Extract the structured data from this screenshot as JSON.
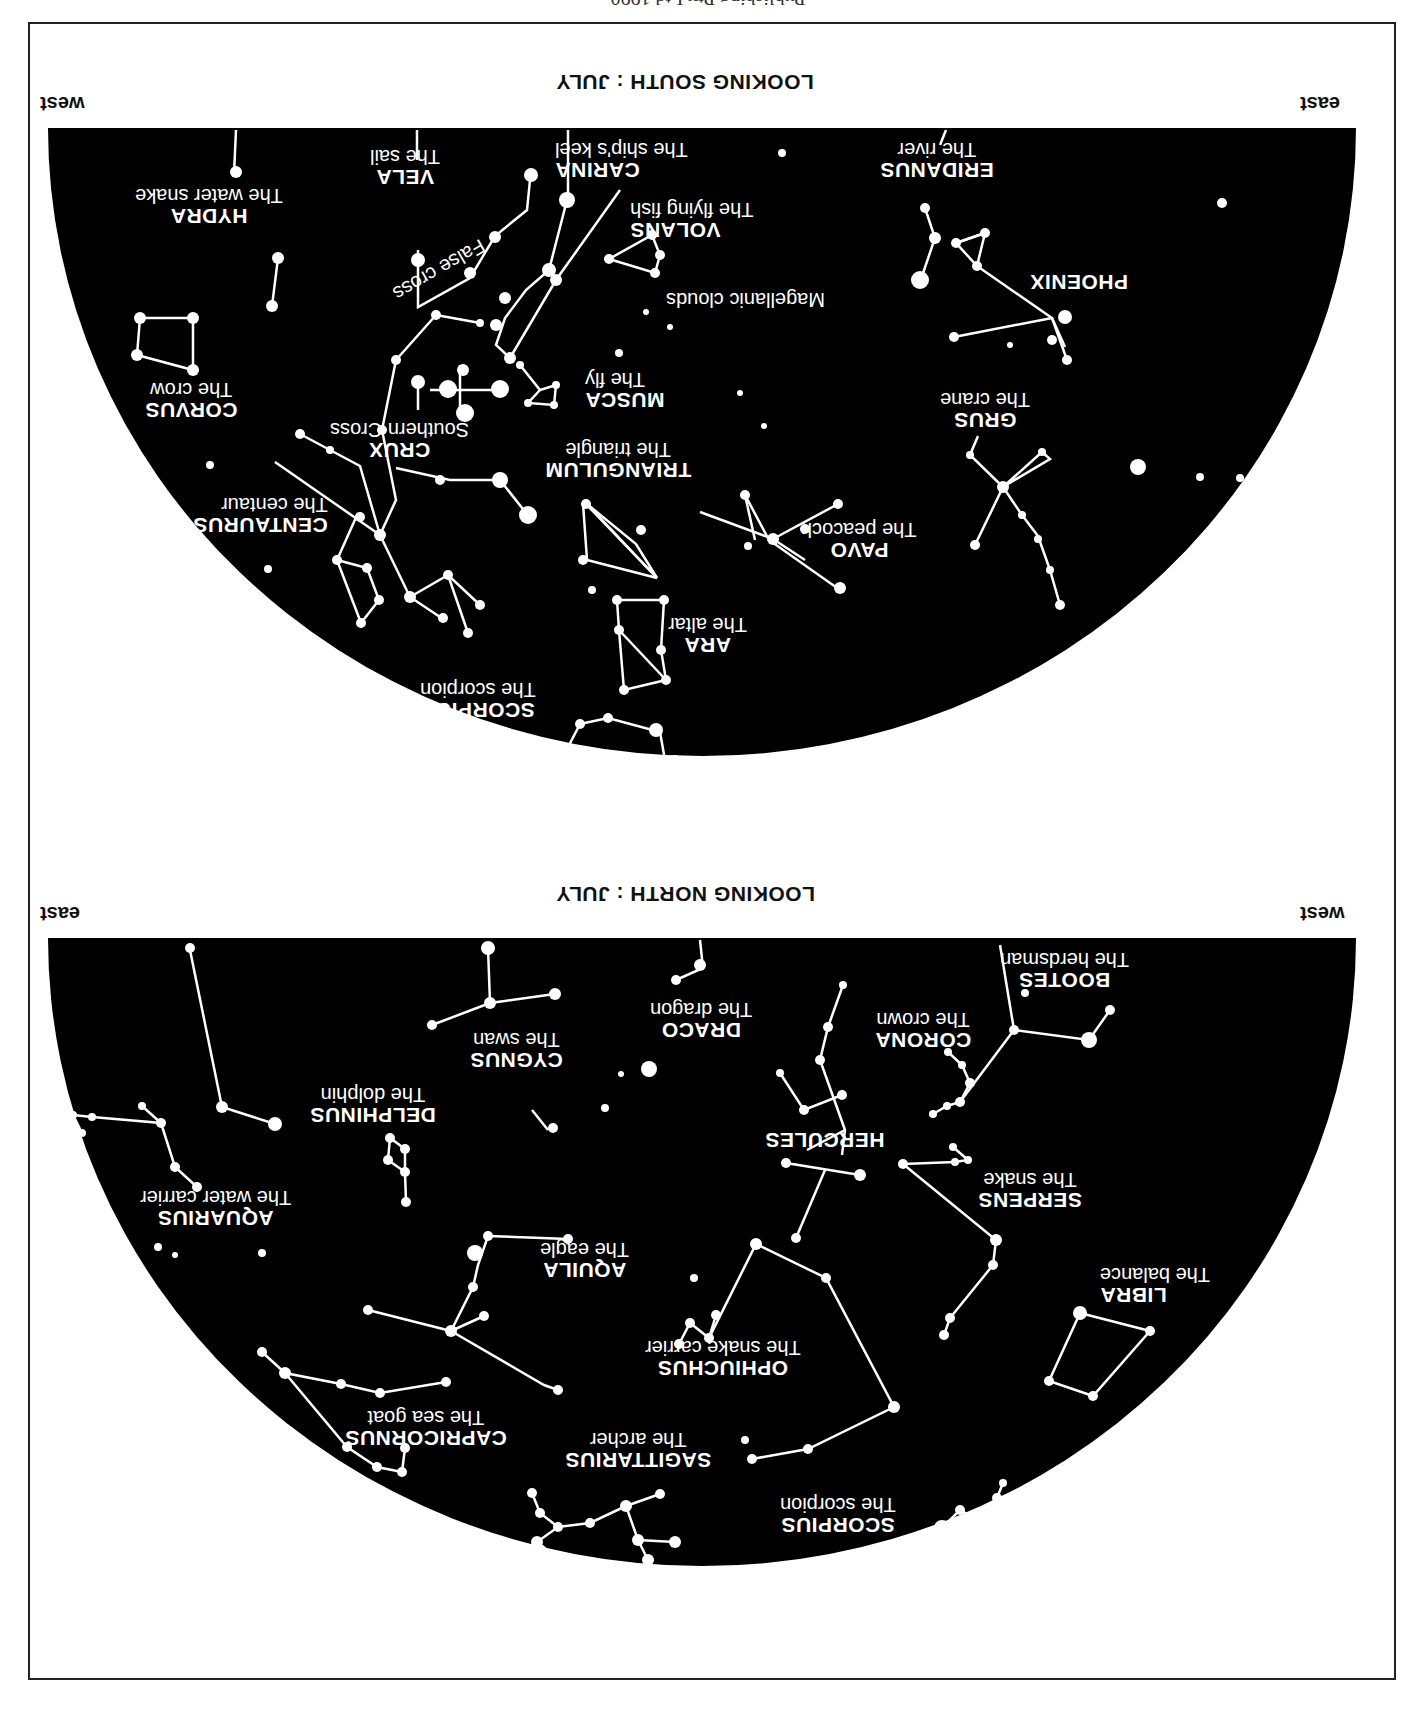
{
  "page": {
    "copyright_fragment": "Publishing Pty Ltd 1990",
    "orientation": "rotated 180 degrees"
  },
  "south_chart": {
    "title": "LOOKING SOUTH : JULY",
    "left_direction": "east",
    "right_direction": "west",
    "constellations": [
      {
        "name": "HYDRA",
        "desc": "The water snake"
      },
      {
        "name": "VELA",
        "desc": "The sail"
      },
      {
        "name": "CARINA",
        "desc": "The ship's keel"
      },
      {
        "name": "ERIDANUS",
        "desc": "The river"
      },
      {
        "name": "VOLANS",
        "desc": "The flying fish"
      },
      {
        "name": "PHOENIX",
        "desc": ""
      },
      {
        "name": "CORVUS",
        "desc": "The crow"
      },
      {
        "name": "MUSCA",
        "desc": "The fly"
      },
      {
        "name": "GRUS",
        "desc": "The crane"
      },
      {
        "name": "CRUX",
        "desc": "Southern Cross"
      },
      {
        "name": "TRIANGULUM",
        "desc": "The triangle"
      },
      {
        "name": "CENTAURUS",
        "desc": "The centaur"
      },
      {
        "name": "PAVO",
        "desc": "The peacock"
      },
      {
        "name": "ARA",
        "desc": "The altar"
      },
      {
        "name": "SCORPIUS",
        "desc": "The scorpion"
      }
    ],
    "annotations": {
      "false_cross": "False cross",
      "magellanic": "Magellanic clouds"
    }
  },
  "north_chart": {
    "title": "LOOKING NORTH : JULY",
    "left_direction": "west",
    "right_direction": "east",
    "constellations": [
      {
        "name": "BOOTES",
        "desc": "The herdsman"
      },
      {
        "name": "CORONA",
        "desc": "The crown"
      },
      {
        "name": "DRACO",
        "desc": "The dragon"
      },
      {
        "name": "CYGNUS",
        "desc": "The swan"
      },
      {
        "name": "DELPHINUS",
        "desc": "The dolphin"
      },
      {
        "name": "HERCULES",
        "desc": ""
      },
      {
        "name": "SERPENS",
        "desc": "The snake"
      },
      {
        "name": "AQUARIUS",
        "desc": "The water carrier"
      },
      {
        "name": "LIBRA",
        "desc": "The balance"
      },
      {
        "name": "AQUILA",
        "desc": "The eagle"
      },
      {
        "name": "OPHIUCHUS",
        "desc": "The snake carrier"
      },
      {
        "name": "CAPRICORNUS",
        "desc": "The sea goat"
      },
      {
        "name": "SAGITTARIUS",
        "desc": "The archer"
      },
      {
        "name": "SCORPIUS",
        "desc": "The scorpion"
      }
    ]
  },
  "colors": {
    "sky": "#000000",
    "stars": "#ffffff",
    "paper": "#ffffff",
    "frame": "#222222"
  }
}
